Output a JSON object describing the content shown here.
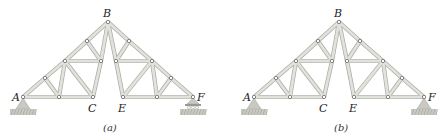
{
  "diagrams": [
    {
      "id": "a",
      "caption": "(a)",
      "offset_x": 0,
      "support_right": "roller",
      "labels": {
        "A": "A",
        "B": "B",
        "C": "C",
        "E": "E",
        "F": "F"
      }
    },
    {
      "id": "b",
      "caption": "(b)",
      "offset_x": 231,
      "support_right": "pin",
      "labels": {
        "A": "A",
        "B": "B",
        "C": "C",
        "E": "E",
        "F": "F"
      }
    }
  ],
  "joints": {
    "A": [
      23,
      97
    ],
    "J1": [
      45,
      78
    ],
    "J2": [
      65,
      61
    ],
    "J3": [
      87,
      41
    ],
    "B": [
      108,
      22
    ],
    "J4": [
      59,
      97
    ],
    "C": [
      93,
      97
    ],
    "J5": [
      101,
      61
    ],
    "J6": [
      116,
      61
    ],
    "J7": [
      129,
      41
    ],
    "J8": [
      152,
      61
    ],
    "J9": [
      171,
      78
    ],
    "F": [
      193,
      97
    ],
    "J10": [
      157,
      97
    ],
    "E": [
      123,
      97
    ]
  },
  "members": [
    [
      "A",
      "J1"
    ],
    [
      "J1",
      "J2"
    ],
    [
      "J2",
      "J3"
    ],
    [
      "J3",
      "B"
    ],
    [
      "A",
      "J4"
    ],
    [
      "J4",
      "C"
    ],
    [
      "J1",
      "J4"
    ],
    [
      "J2",
      "J4"
    ],
    [
      "J2",
      "C"
    ],
    [
      "J2",
      "J5"
    ],
    [
      "J3",
      "J5"
    ],
    [
      "C",
      "J5"
    ],
    [
      "J5",
      "B"
    ],
    [
      "B",
      "J7"
    ],
    [
      "J7",
      "J8"
    ],
    [
      "J8",
      "J9"
    ],
    [
      "J9",
      "F"
    ],
    [
      "E",
      "J10"
    ],
    [
      "J10",
      "F"
    ],
    [
      "J9",
      "J10"
    ],
    [
      "J8",
      "J10"
    ],
    [
      "J8",
      "E"
    ],
    [
      "J8",
      "J6"
    ],
    [
      "J7",
      "J6"
    ],
    [
      "E",
      "J6"
    ],
    [
      "J6",
      "B"
    ]
  ],
  "colors": {
    "member_fill": "#e2e2dc",
    "member_edge": "#a9a9a4",
    "joint": "#555555",
    "ground": "#c9c9c2",
    "ground_hatch": "#9a9a94"
  }
}
